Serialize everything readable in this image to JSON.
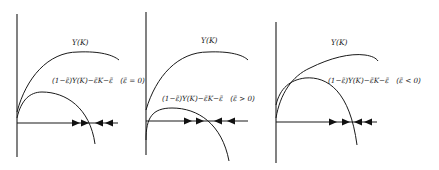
{
  "figure": {
    "panel_count": 3,
    "panels": [
      {
        "id": "panel-1",
        "upper_curve_label": "Y(K)",
        "lower_curve_label": "(1−ε̃)Y(K)−ε̃K−ε̃",
        "condition": "(ε̃ = 0)",
        "arrows": [
          "right",
          "right",
          "left",
          "left"
        ]
      },
      {
        "id": "panel-2",
        "upper_curve_label": "Y(K)",
        "lower_curve_label": "(1−ε̃)Y(K)−ε̃K−ε̃",
        "condition": "(ε̃ > 0)",
        "arrows": [
          "right",
          "right",
          "left",
          "left"
        ]
      },
      {
        "id": "panel-3",
        "upper_curve_label": "Y(K)",
        "lower_curve_label": "(1−ε̃)Y(K)−ε̃K−ε̃",
        "condition": "(ε̃ < 0)",
        "arrows": [
          "right",
          "right",
          "left",
          "left"
        ]
      }
    ],
    "colors": {
      "line": "#1a1a1a",
      "background": "#ffffff"
    }
  }
}
